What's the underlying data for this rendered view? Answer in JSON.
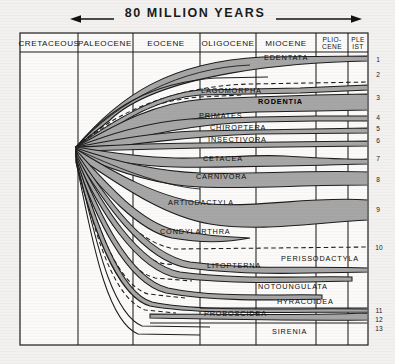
{
  "figure": {
    "scale_label": "80 MILLION YEARS",
    "arrow_left": "left-arrow",
    "arrow_right": "right-arrow"
  },
  "epochs": [
    {
      "label": "CRETACEOUS",
      "x0": 20,
      "x1": 78
    },
    {
      "label": "PALEOCENE",
      "x0": 78,
      "x1": 133
    },
    {
      "label": "EOCENE",
      "x0": 133,
      "x1": 200
    },
    {
      "label": "OLIGOCENE",
      "x0": 200,
      "x1": 256
    },
    {
      "label": "MIOCENE",
      "x0": 256,
      "x1": 316
    },
    {
      "label": "PLIO-\nCENE",
      "line1": "PLIO-",
      "line2": "CENE",
      "x0": 316,
      "x1": 348
    },
    {
      "label": "PLE\nIST",
      "line1": "PLE",
      "line2": "IST",
      "x0": 348,
      "x1": 368
    }
  ],
  "taxa": [
    {
      "n": 1,
      "label": "EDENTATA",
      "label_x": 264,
      "label_y": 60,
      "bold": false,
      "tip_y": 57,
      "num_y": 60
    },
    {
      "n": 2,
      "label": "LAGOMORPHA",
      "label_x": 201,
      "label_y": 93,
      "bold": false,
      "tip_y": 75,
      "num_y": 75
    },
    {
      "n": 3,
      "label": "RODENTIA",
      "label_x": 258,
      "label_y": 104,
      "bold": true,
      "tip_y": 97,
      "num_y": 97
    },
    {
      "n": 4,
      "label": "PRIMATES",
      "label_x": 199,
      "label_y": 118,
      "bold": false,
      "tip_y": 118,
      "num_y": 118
    },
    {
      "n": 5,
      "label": "CHIROPTERA",
      "label_x": 210,
      "label_y": 130,
      "bold": false,
      "tip_y": 129,
      "num_y": 129
    },
    {
      "n": 6,
      "label": "INSECTIVORA",
      "label_x": 208,
      "label_y": 142,
      "bold": false,
      "tip_y": 141,
      "num_y": 141
    },
    {
      "n": 7,
      "label": "CETACEA",
      "label_x": 203,
      "label_y": 161,
      "bold": false,
      "tip_y": 158,
      "num_y": 158
    },
    {
      "n": 8,
      "label": "CARNIVORA",
      "label_x": 196,
      "label_y": 179,
      "bold": false,
      "tip_y": 180,
      "num_y": 180
    },
    {
      "n": 9,
      "label": "ARTIODACTYLA",
      "label_x": 168,
      "label_y": 205,
      "bold": false,
      "tip_y": 208,
      "num_y": 208
    },
    {
      "n": 10,
      "label": "CONDYLARTHRA",
      "label_x": 160,
      "label_y": 234,
      "bold": false,
      "tip_y": 248,
      "num_y": 248
    },
    {
      "n": null,
      "label": "LITOPTERNA",
      "label_x": 207,
      "label_y": 268,
      "bold": false,
      "tip_y": null,
      "num_y": null
    },
    {
      "n": null,
      "label": "PERISSODACTYLA",
      "label_x": 281,
      "label_y": 261,
      "bold": false,
      "tip_y": null,
      "num_y": null
    },
    {
      "n": null,
      "label": "NOTOUNGULATA",
      "label_x": 258,
      "label_y": 289,
      "bold": false,
      "tip_y": null,
      "num_y": null
    },
    {
      "n": null,
      "label": "HYRACOIDEA",
      "label_x": 277,
      "label_y": 304,
      "bold": false,
      "tip_y": null,
      "num_y": null
    },
    {
      "n": 11,
      "label": "PROBOSCIDEA",
      "label_x": 204,
      "label_y": 316,
      "bold": false,
      "tip_y": 314,
      "num_y": 314
    },
    {
      "n": 12,
      "label": null,
      "label_x": null,
      "label_y": null,
      "bold": false,
      "tip_y": 322,
      "num_y": 322
    },
    {
      "n": 13,
      "label": "SIRENIA",
      "label_x": 272,
      "label_y": 334,
      "bold": false,
      "tip_y": 330,
      "num_y": 330
    }
  ],
  "right_numbers": [
    "1",
    "2",
    "3",
    "4",
    "5",
    "6",
    "7",
    "8",
    "9",
    "10",
    "11",
    "12",
    "13"
  ],
  "colors": {
    "band_fill": "#a6a6a6",
    "band_stroke": "#1d1d1d",
    "grid": "#1d1d1d",
    "background": "#f3f1ef",
    "text": "#101010"
  }
}
